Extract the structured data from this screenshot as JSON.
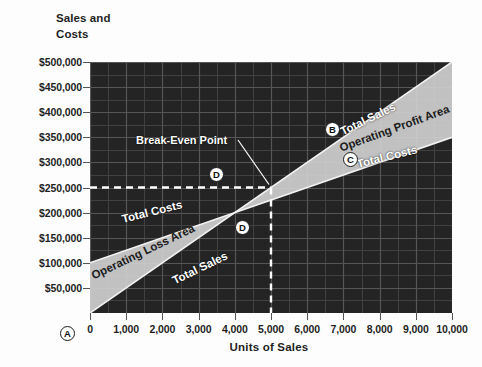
{
  "chart_data": {
    "type": "line",
    "title": "",
    "ylabel": "Sales and Costs",
    "xlabel": "Units of Sales",
    "xlim": [
      0,
      10000
    ],
    "ylim": [
      0,
      500000
    ],
    "grid": true,
    "legend_position": "inline-annotations",
    "x_ticks": [
      "0",
      "1,000",
      "2,000",
      "3,000",
      "4,000",
      "5,000",
      "6,000",
      "7,000",
      "8,000",
      "9,000",
      "10,000"
    ],
    "x_tick_values": [
      0,
      1000,
      2000,
      3000,
      4000,
      5000,
      6000,
      7000,
      8000,
      9000,
      10000
    ],
    "y_ticks": [
      "$50,000",
      "$100,000",
      "$150,000",
      "$200,000",
      "$250,000",
      "$300,000",
      "$350,000",
      "$400,000",
      "$450,000",
      "$500,000"
    ],
    "y_tick_values": [
      50000,
      100000,
      150000,
      200000,
      250000,
      300000,
      350000,
      400000,
      450000,
      500000
    ],
    "series": [
      {
        "name": "Total Sales",
        "x": [
          0,
          10000
        ],
        "values": [
          0,
          500000
        ]
      },
      {
        "name": "Total Costs",
        "x": [
          0,
          10000
        ],
        "values": [
          100000,
          350000
        ]
      }
    ],
    "break_even": {
      "units": 5000,
      "dollars": 250000
    },
    "regions": [
      {
        "name": "Operating Loss Area",
        "x_range": [
          0,
          5000
        ]
      },
      {
        "name": "Operating Profit Area",
        "x_range": [
          5000,
          10000
        ]
      }
    ]
  },
  "axes": {
    "y_title": "Sales and\nCosts",
    "x_title": "Units of Sales"
  },
  "annotations": {
    "break_even_label": "Break-Even Point",
    "left_total_costs": "Total Costs",
    "left_operating_loss": "Operating Loss Area",
    "left_total_sales": "Total Sales",
    "right_total_sales": "Total Sales",
    "right_operating_profit": "Operating Profit Area",
    "right_total_costs": "Total Costs"
  },
  "markers": {
    "a": "A",
    "b": "B",
    "c": "C",
    "d1": "D",
    "d2": "D"
  },
  "colors": {
    "plot_background": "#242424",
    "gridline": "#5a5a5a",
    "band_fill": "#cfcfcf",
    "dashed_guide": "#ffffff",
    "text": "#1f1f1f"
  }
}
